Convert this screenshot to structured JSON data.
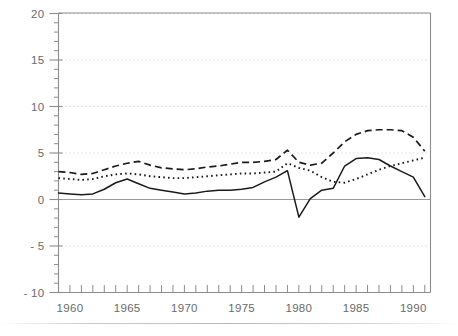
{
  "chart_data": {
    "type": "line",
    "title": "",
    "subtitle": "",
    "xlabel": "",
    "ylabel": "",
    "xlim": [
      1959,
      1991.5
    ],
    "ylim": [
      -10,
      20
    ],
    "yticks": [
      20,
      15,
      10,
      5,
      0,
      "- 5",
      "- 10"
    ],
    "ytick_values": [
      20,
      15,
      10,
      5,
      0,
      -5,
      -10
    ],
    "yminor_step": 1,
    "xticks_labeled": [
      "1960",
      "1965",
      "1970",
      "1975",
      "1980",
      "1985",
      "1990"
    ],
    "xtick_values": [
      1960,
      1965,
      1970,
      1975,
      1980,
      1985,
      1990
    ],
    "xminor_step": 1,
    "grid": "dotted-horizontal-at-major-y",
    "zero_line": true,
    "legend": "none",
    "annotations": [],
    "x": [
      1959,
      1960,
      1961,
      1962,
      1963,
      1964,
      1965,
      1966,
      1967,
      1968,
      1969,
      1970,
      1971,
      1972,
      1973,
      1974,
      1975,
      1976,
      1977,
      1978,
      1979,
      1980,
      1981,
      1982,
      1983,
      1984,
      1985,
      1986,
      1987,
      1988,
      1989,
      1990,
      1991
    ],
    "series": [
      {
        "name": "dashed-series",
        "style": "dashed",
        "values": [
          3.0,
          2.9,
          2.7,
          2.8,
          3.2,
          3.6,
          3.9,
          4.1,
          3.7,
          3.4,
          3.3,
          3.2,
          3.3,
          3.5,
          3.6,
          3.8,
          4.0,
          4.0,
          4.1,
          4.3,
          5.3,
          4.0,
          3.7,
          3.9,
          5.0,
          6.2,
          7.0,
          7.4,
          7.5,
          7.5,
          7.4,
          6.7,
          5.2
        ]
      },
      {
        "name": "dotted-series",
        "style": "dotted",
        "values": [
          2.3,
          2.2,
          2.1,
          2.2,
          2.5,
          2.7,
          2.8,
          2.7,
          2.5,
          2.4,
          2.3,
          2.3,
          2.4,
          2.5,
          2.6,
          2.7,
          2.8,
          2.8,
          2.9,
          3.0,
          3.9,
          3.4,
          3.1,
          2.4,
          1.9,
          1.8,
          2.2,
          2.7,
          3.2,
          3.6,
          3.9,
          4.2,
          4.5
        ]
      },
      {
        "name": "solid-series",
        "style": "solid",
        "values": [
          0.7,
          0.6,
          0.5,
          0.6,
          1.1,
          1.8,
          2.2,
          1.7,
          1.2,
          1.0,
          0.8,
          0.6,
          0.7,
          0.9,
          1.0,
          1.0,
          1.1,
          1.3,
          1.9,
          2.4,
          3.1,
          -1.9,
          0.1,
          1.0,
          1.2,
          3.6,
          4.4,
          4.5,
          4.3,
          3.6,
          3.0,
          2.4,
          0.3
        ]
      }
    ]
  },
  "axes": {
    "left_axis_name": "y-axis",
    "bottom_axis_name": "x-axis"
  }
}
